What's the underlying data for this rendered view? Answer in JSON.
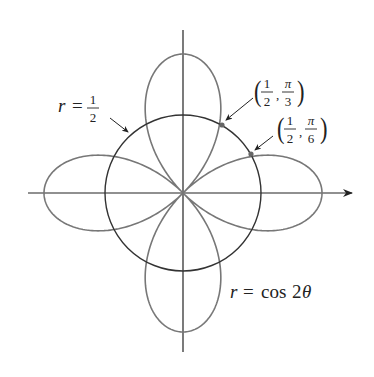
{
  "figure": {
    "type": "polar-graph",
    "origin_px": [
      183,
      193
    ],
    "circle": {
      "equation_lhs": "r",
      "equation_rhs_num": "1",
      "equation_rhs_den": "2",
      "radius_px": 78
    },
    "rose": {
      "equation_lhs": "r",
      "equation_rhs": "cos 2θ",
      "rhs_func": "cos",
      "rhs_arg": "2θ",
      "petals": 4,
      "scale_px": 139
    },
    "points": [
      {
        "r_num": "1",
        "r_den": "2",
        "theta_num": "π",
        "theta_den": "3"
      },
      {
        "r_num": "1",
        "r_den": "2",
        "theta_num": "π",
        "theta_den": "6"
      }
    ],
    "colors": {
      "axes": "#222222",
      "circle": "#333333",
      "rose": "#777777",
      "point": "#666666"
    }
  }
}
